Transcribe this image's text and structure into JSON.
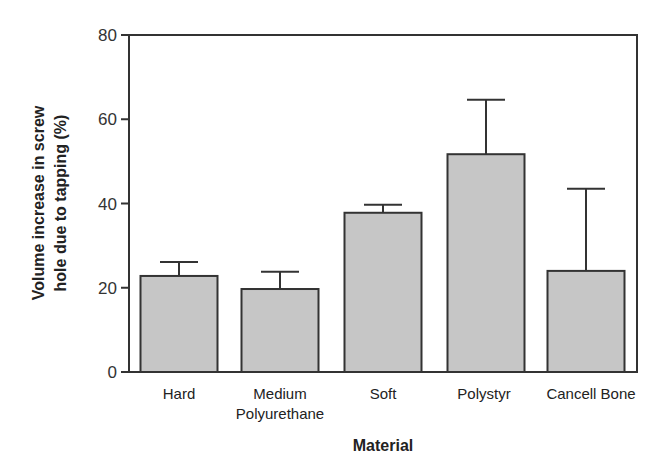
{
  "chart_data": {
    "type": "bar",
    "title": "",
    "xlabel": "Material",
    "ylabel_lines": [
      "Volume increase in screw",
      "hole due to tapping (%)"
    ],
    "ylabel": "Volume increase in screw hole due to tapping (%)",
    "ylim": [
      0,
      80
    ],
    "yticks": [
      0,
      20,
      40,
      60,
      80
    ],
    "grid": false,
    "legend": null,
    "categories": [
      "Hard",
      "Medium",
      "Soft",
      "Polystyr",
      "Cancell Bone"
    ],
    "category_sublabels": [
      "",
      "Polyurethane",
      "",
      "",
      ""
    ],
    "values": [
      22.8,
      19.7,
      37.8,
      51.7,
      24.0
    ],
    "error_upper": [
      26.1,
      23.8,
      39.7,
      64.6,
      43.5
    ],
    "bar_color": "#c6c6c6",
    "edge_color": "#333333"
  }
}
